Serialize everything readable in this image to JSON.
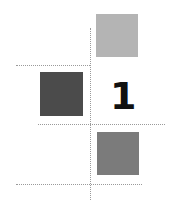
{
  "diagram": {
    "squares": [
      {
        "id": "top-right",
        "color": "#b4b4b4",
        "x": 96,
        "y": 14,
        "w": 42,
        "h": 43
      },
      {
        "id": "middle-left",
        "color": "#4b4b4b",
        "x": 40,
        "y": 72,
        "w": 43,
        "h": 44
      },
      {
        "id": "bottom-right",
        "color": "#7b7b7b",
        "x": 97,
        "y": 132,
        "w": 42,
        "h": 43
      }
    ],
    "label": {
      "text": "1",
      "color": "#111111"
    },
    "dotted_lines": [
      {
        "orientation": "vertical",
        "x": 90,
        "y1": 28,
        "y2": 200
      },
      {
        "orientation": "horizontal",
        "y": 65,
        "x1": 16,
        "x2": 90
      },
      {
        "orientation": "horizontal",
        "y": 124,
        "x1": 38,
        "x2": 165
      },
      {
        "orientation": "horizontal",
        "y": 184,
        "x1": 16,
        "x2": 142
      }
    ]
  }
}
